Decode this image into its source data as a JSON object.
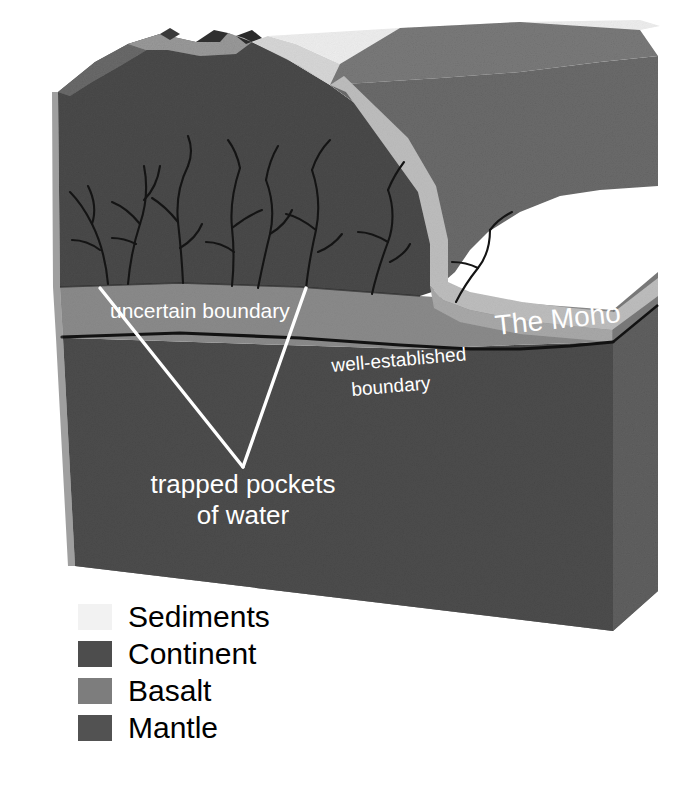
{
  "figure": {
    "type": "geological-block-diagram",
    "title_visible": false,
    "background_color": "#ffffff"
  },
  "annotations": {
    "uncertain_boundary": "uncertain boundary",
    "well_established_line1": "well-established",
    "well_established_line2": "boundary",
    "moho": "The Moho",
    "trapped_line1": "trapped pockets",
    "trapped_line2": "of water"
  },
  "legend": {
    "items": [
      {
        "label": "Sediments",
        "color": "#f2f2f2",
        "swatch_name": "sediments-swatch"
      },
      {
        "label": "Continent",
        "color": "#4d4d4d",
        "swatch_name": "continent-swatch"
      },
      {
        "label": "Basalt",
        "color": "#7d7d7d",
        "swatch_name": "basalt-swatch"
      },
      {
        "label": "Mantle",
        "color": "#525252",
        "swatch_name": "mantle-swatch"
      }
    ]
  },
  "colors": {
    "continent_front": "#4a4a4a",
    "continent_top": "#6e6e6e",
    "continent_side": "#5e5e5e",
    "basalt_band": "#8a8a8a",
    "basalt_side": "#777777",
    "mantle_front": "#4f4f4f",
    "mantle_bottom": "#5a5a5a",
    "mantle_side": "#606060",
    "sediment_light": "#ededed",
    "sediment_mid": "#c9c9c9",
    "mountain_light": "#8e8e8e",
    "mountain_dark": "#3b3b3b",
    "outline": "#111111",
    "leader_line": "#ffffff",
    "label_text": "#ffffff"
  },
  "geometry_notes": {
    "projection": "3D block, viewer front-left face, top face receding up-right",
    "layers_top_to_bottom": [
      "Sediments",
      "Continent",
      "Basalt",
      "Mantle"
    ],
    "fracture_count": 7,
    "leader_apex": {
      "x": 243,
      "y": 467
    },
    "leader_left_start": {
      "x": 100,
      "y": 288
    },
    "leader_right_start": {
      "x": 306,
      "y": 288
    }
  }
}
